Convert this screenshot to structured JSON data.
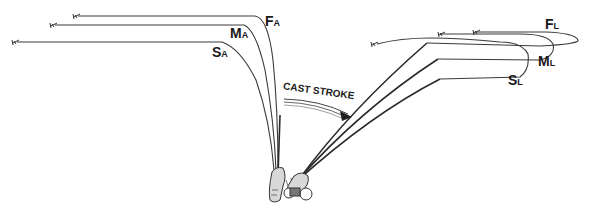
{
  "diagram": {
    "arrow_label": "CAST STROKE",
    "phase_before": {
      "name": "A",
      "curves": [
        {
          "key": "F",
          "subscript": "A",
          "meaning": "fast"
        },
        {
          "key": "M",
          "subscript": "A",
          "meaning": "medium"
        },
        {
          "key": "S",
          "subscript": "A",
          "meaning": "slow"
        }
      ]
    },
    "phase_after": {
      "name": "L",
      "curves": [
        {
          "key": "F",
          "subscript": "L",
          "meaning": "fast"
        },
        {
          "key": "M",
          "subscript": "L",
          "meaning": "medium"
        },
        {
          "key": "S",
          "subscript": "L",
          "meaning": "slow"
        }
      ]
    },
    "labels": {
      "FA_main": "F",
      "FA_sub": "A",
      "MA_main": "M",
      "MA_sub": "A",
      "SA_main": "S",
      "SA_sub": "A",
      "FL_main": "F",
      "FL_sub": "L",
      "ML_main": "M",
      "ML_sub": "L",
      "SL_main": "S",
      "SL_sub": "L"
    },
    "colors": {
      "ink": "#2a2a2a",
      "background": "#ffffff"
    }
  }
}
